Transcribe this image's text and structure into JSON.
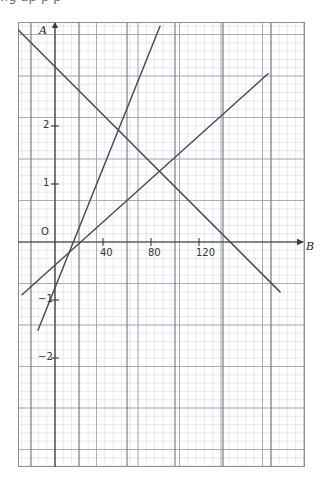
{
  "page": {
    "top_cropped_text": "fig  ap       p          p"
  },
  "chart_data": {
    "type": "line",
    "title": "",
    "xlabel": "B",
    "ylabel": "A",
    "grid": true,
    "grid_minor": true,
    "legend": false,
    "xlim": [
      -31,
      190
    ],
    "ylim": [
      -2.6,
      4.2
    ],
    "x_ticks": [
      40,
      80,
      120
    ],
    "x_tick_labels": [
      "40",
      "80",
      "120"
    ],
    "y_ticks": [
      2,
      1,
      0,
      -1,
      -2
    ],
    "y_tick_labels": [
      "2",
      "1",
      "O",
      "−1",
      "−2"
    ],
    "origin_label": "O",
    "x_axis_arrow": true,
    "y_axis_arrow": true,
    "x_major_gridlines": [
      -20,
      20,
      60,
      100,
      140,
      180
    ],
    "series": [
      {
        "name": "steep-rising-line",
        "kind": "segment",
        "points": [
          [
            -14.2,
            -1.52
          ],
          [
            87.5,
            3.72
          ]
        ]
      },
      {
        "name": "gentle-rising-line",
        "kind": "segment",
        "points": [
          [
            -27.5,
            -0.91
          ],
          [
            177.5,
            2.9
          ]
        ]
      },
      {
        "name": "descending-line",
        "kind": "segment",
        "points": [
          [
            -30.8,
            3.66
          ],
          [
            187.5,
            -0.86
          ]
        ]
      }
    ],
    "intersections": [
      {
        "name": "steep-descending",
        "point": [
          37,
          1.58
        ]
      },
      {
        "name": "gentle-descending",
        "point": [
          103,
          1.15
        ]
      }
    ]
  }
}
